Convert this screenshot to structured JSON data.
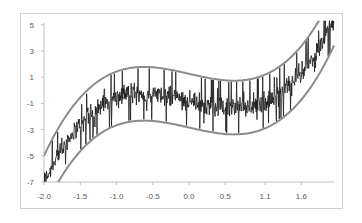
{
  "chart_data": {
    "type": "line",
    "title": "",
    "xlabel": "",
    "ylabel": "",
    "xlim": [
      -2.0,
      2.0
    ],
    "ylim": [
      -7,
      5
    ],
    "x_tick_labels": [
      "-2.0",
      "-1.5",
      "-1.0",
      "-0.5",
      "0.0",
      "0.5",
      "1.1",
      "1.6"
    ],
    "x_tick_values": [
      -2.0,
      -1.5,
      -1.0,
      -0.5,
      0.0,
      0.5,
      1.05,
      1.55
    ],
    "y_tick_labels": [
      "5",
      "3",
      "1",
      "-1",
      "-3",
      "-5",
      "-7"
    ],
    "y_tick_values": [
      5,
      3,
      1,
      -1,
      -3,
      -5,
      -7
    ],
    "grid": false,
    "legend": null,
    "series": [
      {
        "name": "upper band",
        "color": "#8c8c8c",
        "width": 2,
        "x": [
          -2.0,
          -1.75,
          -1.5,
          -1.25,
          -1.0,
          -0.75,
          -0.5,
          -0.25,
          0.0,
          0.25,
          0.5,
          0.75,
          1.0,
          1.25,
          1.5,
          1.75
        ],
        "values": [
          -5.0,
          -2.43,
          -0.55,
          0.7,
          1.43,
          1.75,
          1.76,
          1.56,
          1.26,
          0.96,
          0.76,
          0.76,
          1.09,
          1.8,
          3.06,
          5.0
        ]
      },
      {
        "name": "lower band",
        "color": "#8c8c8c",
        "width": 2,
        "x": [
          -1.8,
          -1.5,
          -1.25,
          -1.0,
          -0.75,
          -0.5,
          -0.25,
          0.0,
          0.25,
          0.5,
          0.75,
          1.0,
          1.25,
          1.5,
          1.75,
          2.0
        ],
        "values": [
          -7.0,
          -4.65,
          -3.4,
          -2.67,
          -2.35,
          -2.34,
          -2.54,
          -2.84,
          -3.14,
          -3.34,
          -3.34,
          -3.01,
          -2.3,
          -1.04,
          0.9,
          3.0
        ]
      },
      {
        "name": "noisy data",
        "color": "#1a1a1a",
        "width": 1,
        "x": [
          -2.0,
          -1.75,
          -1.5,
          -1.25,
          -1.0,
          -0.75,
          -0.5,
          -0.25,
          0.0,
          0.25,
          0.5,
          0.75,
          1.0,
          1.25,
          1.5,
          1.75,
          1.95
        ],
        "values": [
          -6.6,
          -4.5,
          -2.6,
          -1.35,
          -0.62,
          -0.3,
          -0.29,
          -0.49,
          -0.79,
          -1.09,
          -1.29,
          -1.29,
          -0.96,
          -0.25,
          1.01,
          2.95,
          4.3
        ],
        "noise_amplitude": 0.6,
        "spike_amplitude": 2.0
      }
    ]
  },
  "model": {
    "upper": {
      "a": 1.1,
      "b": 1.27,
      "c": 1.26
    },
    "band_width": 4.1,
    "samples": 700
  }
}
